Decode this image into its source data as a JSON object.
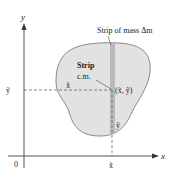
{
  "diagram": {
    "axes": {
      "x_label": "x",
      "y_label": "y",
      "origin_label": "0"
    },
    "labels": {
      "strip_mass": "Strip of mass Δm",
      "strip_cm_line1": "Strip",
      "strip_cm_line2": "c.m.",
      "point": "(x̃, ỹ)",
      "x_tilde_axis": "x̃",
      "y_tilde_axis": "ỹ",
      "x_tilde_inside": "x̃",
      "y_tilde_inside": "ỹ"
    },
    "colors": {
      "plate_fill": "#e2e2e2",
      "plate_stroke": "#8a8a8a",
      "strip_fill": "#b9b9b9",
      "axis": "#555555",
      "dashed": "#666666"
    }
  }
}
